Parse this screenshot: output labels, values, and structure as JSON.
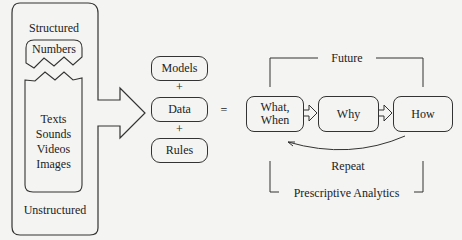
{
  "left_panel": {
    "top_label": "Structured",
    "numbers_label": "Numbers",
    "unstructured_items": [
      "Texts",
      "Sounds",
      "Videos",
      "Images"
    ],
    "bottom_label": "Unstructured"
  },
  "middle": {
    "items": [
      "Models",
      "Data",
      "Rules"
    ],
    "plus": "+",
    "equals": "="
  },
  "right": {
    "top_label": "Future",
    "steps": [
      "What,\nWhen",
      "Why",
      "How"
    ],
    "step_what": "What,",
    "step_when": "When",
    "repeat_label": "Repeat",
    "bottom_label": "Prescriptive Analytics"
  }
}
